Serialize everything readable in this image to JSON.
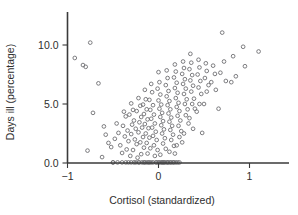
{
  "chart_data": {
    "type": "scatter",
    "title": "",
    "xlabel": "Cortisol (standardized)",
    "ylabel": "Days ill (percentage)",
    "xlim": [
      -1.12,
      1.42
    ],
    "ylim": [
      -0.15,
      11.6
    ],
    "xticks": [
      -1,
      0,
      1
    ],
    "xticklabels": [
      "−1",
      "0",
      "1"
    ],
    "yticks": [
      0.0,
      5.0,
      10.0
    ],
    "yticklabels": [
      "0.0",
      "5.0",
      "10.0"
    ],
    "grid": false,
    "legend": null,
    "marker": "open-circle",
    "marker_color": "#6e6e72",
    "background_color": "#ffffff",
    "axis_color": "#3a3a3a",
    "n_points": 214,
    "points": [
      [
        -0.92,
        8.9
      ],
      [
        -0.75,
        10.2
      ],
      [
        -0.83,
        8.3
      ],
      [
        -0.8,
        8.15
      ],
      [
        -0.66,
        6.75
      ],
      [
        -0.72,
        4.25
      ],
      [
        -0.78,
        1.05
      ],
      [
        -0.6,
        3.1
      ],
      [
        -0.58,
        2.4
      ],
      [
        -0.55,
        1.7
      ],
      [
        -0.52,
        1.35
      ],
      [
        -0.62,
        0.5
      ],
      [
        -0.5,
        0.05
      ],
      [
        -0.46,
        3.35
      ],
      [
        -0.44,
        2.55
      ],
      [
        -0.48,
        2.05
      ],
      [
        -0.42,
        1.5
      ],
      [
        -0.4,
        0.85
      ],
      [
        -0.45,
        0.05
      ],
      [
        -0.38,
        4.35
      ],
      [
        -0.36,
        3.95
      ],
      [
        -0.39,
        3.15
      ],
      [
        -0.34,
        2.75
      ],
      [
        -0.37,
        2.25
      ],
      [
        -0.33,
        1.85
      ],
      [
        -0.35,
        1.15
      ],
      [
        -0.31,
        0.6
      ],
      [
        -0.36,
        0.05
      ],
      [
        -0.3,
        5.05
      ],
      [
        -0.28,
        4.5
      ],
      [
        -0.32,
        4.1
      ],
      [
        -0.27,
        3.6
      ],
      [
        -0.29,
        3.25
      ],
      [
        -0.25,
        2.9
      ],
      [
        -0.3,
        2.45
      ],
      [
        -0.26,
        2.0
      ],
      [
        -0.24,
        1.6
      ],
      [
        -0.28,
        1.1
      ],
      [
        -0.23,
        0.45
      ],
      [
        -0.27,
        0.05
      ],
      [
        -0.22,
        5.5
      ],
      [
        -0.2,
        4.85
      ],
      [
        -0.24,
        4.4
      ],
      [
        -0.19,
        3.9
      ],
      [
        -0.21,
        3.45
      ],
      [
        -0.18,
        3.0
      ],
      [
        -0.22,
        2.6
      ],
      [
        -0.17,
        2.2
      ],
      [
        -0.2,
        1.75
      ],
      [
        -0.16,
        1.3
      ],
      [
        -0.19,
        0.75
      ],
      [
        -0.21,
        0.05
      ],
      [
        -0.15,
        6.2
      ],
      [
        -0.14,
        5.4
      ],
      [
        -0.17,
        4.95
      ],
      [
        -0.13,
        4.55
      ],
      [
        -0.16,
        4.15
      ],
      [
        -0.12,
        3.7
      ],
      [
        -0.15,
        3.3
      ],
      [
        -0.11,
        2.95
      ],
      [
        -0.14,
        2.5
      ],
      [
        -0.1,
        2.15
      ],
      [
        -0.13,
        1.7
      ],
      [
        -0.09,
        1.25
      ],
      [
        -0.12,
        0.8
      ],
      [
        -0.15,
        0.05
      ],
      [
        -0.11,
        0.05
      ],
      [
        -0.08,
        6.7
      ],
      [
        -0.07,
        6.0
      ],
      [
        -0.1,
        5.35
      ],
      [
        -0.06,
        4.9
      ],
      [
        -0.09,
        4.5
      ],
      [
        -0.05,
        4.1
      ],
      [
        -0.08,
        3.75
      ],
      [
        -0.04,
        3.35
      ],
      [
        -0.07,
        3.0
      ],
      [
        -0.03,
        2.65
      ],
      [
        -0.06,
        2.3
      ],
      [
        -0.02,
        1.95
      ],
      [
        -0.05,
        1.5
      ],
      [
        -0.01,
        1.1
      ],
      [
        -0.04,
        0.6
      ],
      [
        -0.06,
        0.05
      ],
      [
        -0.02,
        0.05
      ],
      [
        0.0,
        7.7
      ],
      [
        0.01,
        6.85
      ],
      [
        -0.01,
        6.3
      ],
      [
        0.02,
        5.8
      ],
      [
        0.0,
        5.3
      ],
      [
        0.03,
        4.95
      ],
      [
        0.01,
        4.6
      ],
      [
        0.04,
        4.25
      ],
      [
        0.02,
        3.9
      ],
      [
        0.05,
        3.55
      ],
      [
        0.03,
        3.2
      ],
      [
        0.06,
        2.85
      ],
      [
        0.04,
        2.5
      ],
      [
        0.07,
        2.1
      ],
      [
        0.05,
        1.65
      ],
      [
        0.08,
        1.2
      ],
      [
        0.02,
        0.7
      ],
      [
        0.0,
        0.05
      ],
      [
        0.04,
        0.05
      ],
      [
        0.07,
        0.05
      ],
      [
        0.09,
        7.85
      ],
      [
        0.1,
        7.2
      ],
      [
        0.08,
        6.6
      ],
      [
        0.11,
        6.1
      ],
      [
        0.09,
        5.65
      ],
      [
        0.12,
        5.25
      ],
      [
        0.1,
        4.9
      ],
      [
        0.13,
        4.55
      ],
      [
        0.11,
        4.2
      ],
      [
        0.14,
        3.85
      ],
      [
        0.12,
        3.5
      ],
      [
        0.15,
        3.15
      ],
      [
        0.13,
        2.8
      ],
      [
        0.16,
        2.4
      ],
      [
        0.14,
        1.95
      ],
      [
        0.17,
        1.45
      ],
      [
        0.12,
        0.95
      ],
      [
        0.1,
        0.05
      ],
      [
        0.14,
        0.05
      ],
      [
        0.17,
        0.05
      ],
      [
        0.18,
        8.35
      ],
      [
        0.19,
        7.75
      ],
      [
        0.17,
        7.25
      ],
      [
        0.2,
        6.8
      ],
      [
        0.18,
        6.35
      ],
      [
        0.21,
        5.95
      ],
      [
        0.19,
        5.5
      ],
      [
        0.22,
        5.1
      ],
      [
        0.2,
        4.75
      ],
      [
        0.23,
        4.4
      ],
      [
        0.21,
        4.0
      ],
      [
        0.24,
        3.6
      ],
      [
        0.22,
        3.15
      ],
      [
        0.25,
        2.7
      ],
      [
        0.23,
        2.2
      ],
      [
        0.2,
        1.5
      ],
      [
        0.18,
        0.8
      ],
      [
        0.21,
        0.05
      ],
      [
        0.27,
        8.6
      ],
      [
        0.28,
        8.05
      ],
      [
        0.26,
        7.55
      ],
      [
        0.29,
        7.1
      ],
      [
        0.27,
        6.7
      ],
      [
        0.3,
        6.3
      ],
      [
        0.28,
        5.85
      ],
      [
        0.31,
        5.4
      ],
      [
        0.29,
        5.0
      ],
      [
        0.32,
        4.55
      ],
      [
        0.3,
        4.05
      ],
      [
        0.33,
        3.35
      ],
      [
        0.28,
        2.5
      ],
      [
        0.26,
        1.75
      ],
      [
        0.35,
        9.25
      ],
      [
        0.36,
        8.5
      ],
      [
        0.34,
        7.95
      ],
      [
        0.37,
        7.45
      ],
      [
        0.35,
        7.0
      ],
      [
        0.38,
        6.55
      ],
      [
        0.36,
        6.05
      ],
      [
        0.39,
        5.45
      ],
      [
        0.37,
        5.0
      ],
      [
        0.4,
        4.6
      ],
      [
        0.34,
        3.8
      ],
      [
        0.38,
        2.9
      ],
      [
        0.44,
        8.75
      ],
      [
        0.45,
        8.1
      ],
      [
        0.43,
        7.5
      ],
      [
        0.46,
        6.95
      ],
      [
        0.44,
        6.4
      ],
      [
        0.47,
        5.85
      ],
      [
        0.45,
        5.0
      ],
      [
        0.42,
        4.35
      ],
      [
        0.48,
        2.55
      ],
      [
        0.52,
        8.45
      ],
      [
        0.53,
        7.8
      ],
      [
        0.51,
        7.2
      ],
      [
        0.55,
        6.6
      ],
      [
        0.53,
        6.05
      ],
      [
        0.5,
        5.0
      ],
      [
        0.6,
        8.25
      ],
      [
        0.62,
        7.55
      ],
      [
        0.58,
        6.85
      ],
      [
        0.63,
        6.2
      ],
      [
        0.7,
        11.05
      ],
      [
        0.72,
        8.6
      ],
      [
        0.68,
        7.65
      ],
      [
        0.74,
        6.95
      ],
      [
        0.66,
        4.6
      ],
      [
        0.82,
        9.05
      ],
      [
        0.85,
        7.35
      ],
      [
        0.8,
        6.85
      ],
      [
        0.93,
        9.85
      ],
      [
        0.95,
        8.2
      ],
      [
        1.1,
        9.45
      ],
      [
        -0.5,
        0.05
      ],
      [
        -0.4,
        0.05
      ],
      [
        -0.33,
        0.05
      ],
      [
        -0.25,
        0.05
      ],
      [
        -0.18,
        0.05
      ],
      [
        -0.13,
        0.05
      ],
      [
        -0.08,
        0.05
      ],
      [
        -0.03,
        0.05
      ],
      [
        0.01,
        0.05
      ],
      [
        0.05,
        0.05
      ],
      [
        0.09,
        0.05
      ],
      [
        0.13,
        0.05
      ],
      [
        0.16,
        0.05
      ],
      [
        0.19,
        0.05
      ],
      [
        0.23,
        0.05
      ],
      [
        -0.3,
        0.05
      ],
      [
        -0.22,
        0.05
      ],
      [
        0.11,
        0.05
      ],
      [
        0.06,
        0.05
      ],
      [
        -0.16,
        0.05
      ],
      [
        0.03,
        0.05
      ],
      [
        -0.1,
        0.05
      ]
    ]
  }
}
